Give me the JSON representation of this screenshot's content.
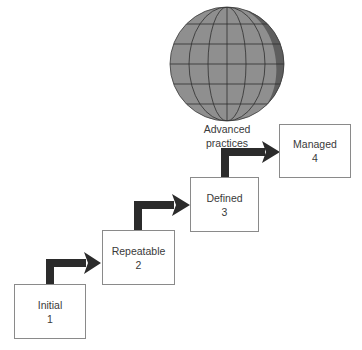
{
  "diagram": {
    "globe_label_line1": "Advanced",
    "globe_label_line2": "practices",
    "levels": [
      {
        "name": "Initial",
        "number": "1"
      },
      {
        "name": "Repeatable",
        "number": "2"
      },
      {
        "name": "Defined",
        "number": "3"
      },
      {
        "name": "Managed",
        "number": "4"
      }
    ],
    "colors": {
      "globe_fill": "#8f8f8f",
      "globe_shadow": "#5e5e5e",
      "globe_lines": "#2e2e2e",
      "arrow": "#2b2b2b",
      "box_border": "#8a8a8a"
    }
  }
}
